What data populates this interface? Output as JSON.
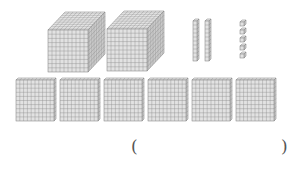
{
  "diagram": {
    "type": "base-ten-blocks",
    "colors": {
      "face": "#e2e2e2",
      "side": "#d2d2d2",
      "top": "#ececec",
      "grid": "#8c8c8c",
      "outline": "#7a7a7a"
    },
    "thousands_cubes": {
      "count": 2,
      "items": [
        {
          "x": 48,
          "y": 30
        },
        {
          "x": 107,
          "y": 29
        }
      ]
    },
    "tens_rods": {
      "count": 2,
      "items": [
        {
          "x": 193,
          "y": 18
        },
        {
          "x": 205,
          "y": 18
        }
      ]
    },
    "ones_units": {
      "count": 5,
      "items": [
        {
          "x": 240,
          "y": 20
        },
        {
          "x": 240,
          "y": 28
        },
        {
          "x": 240,
          "y": 36
        },
        {
          "x": 240,
          "y": 44
        },
        {
          "x": 240,
          "y": 52
        }
      ]
    },
    "hundreds_flats": {
      "count": 6,
      "items": [
        {
          "x": 16,
          "y": 78
        },
        {
          "x": 60,
          "y": 78
        },
        {
          "x": 104,
          "y": 78
        },
        {
          "x": 148,
          "y": 78
        },
        {
          "x": 192,
          "y": 78
        },
        {
          "x": 236,
          "y": 78
        }
      ]
    }
  },
  "answer": {
    "open_paren": "(",
    "close_paren": ")",
    "value": ""
  }
}
